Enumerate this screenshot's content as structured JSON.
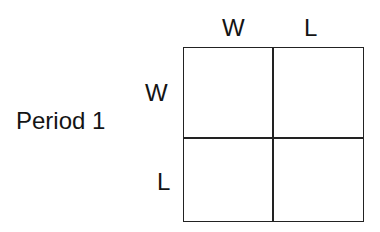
{
  "diagram": {
    "row_title": "Period 1",
    "column_headers": [
      "W",
      "L"
    ],
    "row_headers": [
      "W",
      "L"
    ],
    "cells": [
      [
        "",
        ""
      ],
      [
        "",
        ""
      ]
    ],
    "line_color": "#222222"
  }
}
